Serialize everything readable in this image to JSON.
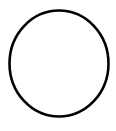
{
  "canvas": {
    "width": 116,
    "height": 131,
    "background_color": "#ffffff",
    "title": "Circle Outline"
  },
  "diagram": {
    "type": "shape-drawing",
    "shape_count": 1,
    "shapes": [
      {
        "name": "circle",
        "kind": "ellipse",
        "filled": false,
        "fill_color": "none",
        "stroke_color": "#000000",
        "stroke_width": 2.6,
        "center_x": 59,
        "center_y": 63.5,
        "radius_x": 49.5,
        "radius_y": 53,
        "bounds": {
          "left": 9.5,
          "top": 10.5,
          "right": 108.5,
          "bottom": 116.5
        }
      }
    ]
  },
  "text_content": {
    "labels": [],
    "has_text": false
  }
}
